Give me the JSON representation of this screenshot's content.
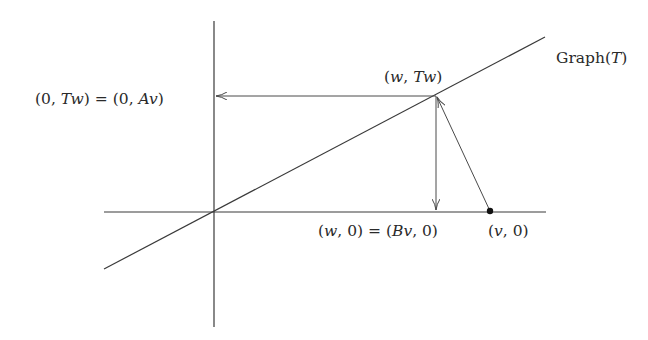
{
  "diagram": {
    "type": "geometric construction (graph of linear operator)",
    "colors": {
      "line": "#3a3a3a",
      "text": "#2a2a2a",
      "background": "#ffffff"
    },
    "axes": {
      "origin": [
        214,
        212
      ],
      "horizontal": {
        "x1": 104,
        "x2": 546,
        "y": 212
      },
      "vertical": {
        "x": 214,
        "y1": 21,
        "y2": 327
      }
    },
    "graph_line": {
      "x1": 104,
      "y1": 269,
      "x2": 545,
      "y2": 37
    },
    "points": {
      "w_Tw": [
        436,
        96
      ],
      "w_0": [
        436,
        212
      ],
      "v_0": [
        490,
        212
      ],
      "zero_Tw": [
        214,
        96
      ]
    },
    "labels": {
      "graph": {
        "prefix": "Graph(",
        "var": "T",
        "suffix": ")"
      },
      "w_Tw": {
        "open": "(",
        "a": "w",
        "sep": ", ",
        "b": "Tw",
        "close": ")"
      },
      "zero_Tw": {
        "text_1": "(0, ",
        "v1": "Tw",
        "text_2": ") = (0, ",
        "v2": "Av",
        "text_3": ")"
      },
      "w_0": {
        "text_1": "(",
        "v1": "w",
        "text_2": ", 0) = (",
        "v2": "Bv",
        "text_3": ", 0)"
      },
      "v_0": {
        "text_1": "(",
        "v1": "v",
        "text_2": ", 0)"
      }
    },
    "arrows": [
      {
        "name": "projection-to-vertical-axis",
        "from": "w_Tw",
        "to": "zero_Tw"
      },
      {
        "name": "projection-to-horizontal-axis",
        "from": "w_Tw",
        "to": "w_0"
      },
      {
        "name": "map-v-to-graph-point",
        "from": "v_0",
        "to": "w_Tw"
      }
    ]
  }
}
